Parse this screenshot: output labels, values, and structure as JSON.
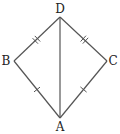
{
  "diagram": {
    "type": "geometry",
    "shape": "kite",
    "stroke_color": "#555555",
    "label_color": "#222222",
    "vertices": [
      {
        "name": "D",
        "x": 60,
        "y": 17,
        "label_x": 60,
        "label_y": 13
      },
      {
        "name": "B",
        "x": 14,
        "y": 61,
        "label_x": 6,
        "label_y": 65
      },
      {
        "name": "C",
        "x": 107,
        "y": 61,
        "label_x": 113,
        "label_y": 65
      },
      {
        "name": "A",
        "x": 60,
        "y": 118,
        "label_x": 60,
        "label_y": 131
      }
    ],
    "segments": [
      {
        "from": "D",
        "to": "B",
        "tick_marks": 2
      },
      {
        "from": "D",
        "to": "C",
        "tick_marks": 2
      },
      {
        "from": "B",
        "to": "A",
        "tick_marks": 1
      },
      {
        "from": "C",
        "to": "A",
        "tick_marks": 1
      },
      {
        "from": "D",
        "to": "A",
        "tick_marks": 0
      }
    ],
    "labels": {
      "D": "D",
      "B": "B",
      "C": "C",
      "A": "A"
    }
  }
}
